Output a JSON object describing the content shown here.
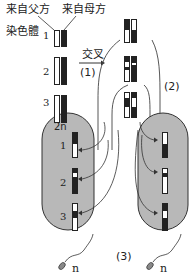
{
  "labels": {
    "paternal": "来自父方",
    "maternal": "来自母方",
    "chromosome": "染色體",
    "crossover": "交叉",
    "step1": "(1)",
    "step2": "(2)",
    "step3": "(3)",
    "diploid": "2n",
    "haploid_left": "n",
    "haploid_right": "n"
  },
  "chromosome_numbers": [
    "1",
    "2",
    "3"
  ],
  "cell_numbers_left": [
    "1",
    "2",
    "3"
  ],
  "colors": {
    "cell_fill": "#b8b8b8",
    "cell_stroke": "#333333",
    "dark_chromosome": "#222222",
    "light_chromosome": "#ffffff"
  }
}
